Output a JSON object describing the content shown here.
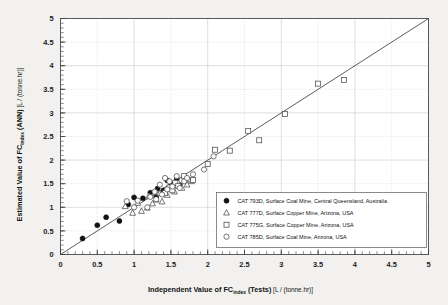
{
  "chart_data": {
    "type": "scatter",
    "title": "",
    "xlabel": "Independent Value of FC",
    "xlabel_sub": "index",
    "xlabel_tail": " (Tests)",
    "xunit": "[L / (tonne.hr)]",
    "ylabel": "Estimated Value of FC",
    "ylabel_sub": "index",
    "ylabel_tail": " (ANN)",
    "yunit": "[L / (tonne.hr)]",
    "xlim": [
      0,
      5
    ],
    "ylim": [
      0,
      5
    ],
    "xticks": [
      "0",
      "0.5",
      "1",
      "1.5",
      "2",
      "2.5",
      "3",
      "3.5",
      "4",
      "4.5",
      "5"
    ],
    "yticks": [
      "0",
      "0.5",
      "1",
      "1.5",
      "2",
      "2.5",
      "3",
      "3.5",
      "4",
      "4.5",
      "5"
    ],
    "minor_tick_step": 0.1,
    "grid": true,
    "legend_position": "lower-right",
    "reference_line": {
      "name": "y = x",
      "from": [
        0,
        0
      ],
      "to": [
        5,
        5
      ]
    },
    "series": [
      {
        "name": "CAT 793D, Surface Coal Mine, Central Queensland, Australia",
        "marker": "filled-circle",
        "points": [
          [
            0.3,
            0.34
          ],
          [
            0.5,
            0.62
          ],
          [
            0.62,
            0.79
          ],
          [
            0.8,
            0.71
          ],
          [
            0.92,
            1.06
          ],
          [
            1.0,
            1.21
          ],
          [
            1.12,
            1.19
          ],
          [
            1.22,
            1.31
          ],
          [
            1.3,
            1.22
          ],
          [
            1.32,
            1.4
          ],
          [
            1.4,
            1.36
          ],
          [
            1.45,
            1.57
          ],
          [
            1.48,
            1.43
          ],
          [
            1.52,
            1.49
          ],
          [
            1.58,
            1.6
          ],
          [
            1.62,
            1.47
          ]
        ]
      },
      {
        "name": "CAT 777D, Surface Copper Mine, Arizona, USA",
        "marker": "open-triangle",
        "points": [
          [
            0.88,
            1.02
          ],
          [
            0.98,
            0.88
          ],
          [
            1.05,
            1.09
          ],
          [
            1.1,
            0.92
          ],
          [
            1.18,
            0.99
          ],
          [
            1.2,
            1.24
          ],
          [
            1.25,
            1.08
          ],
          [
            1.3,
            1.16
          ],
          [
            1.35,
            1.3
          ],
          [
            1.38,
            1.12
          ],
          [
            1.42,
            1.35
          ],
          [
            1.45,
            1.26
          ],
          [
            1.5,
            1.45
          ],
          [
            1.55,
            1.33
          ],
          [
            1.6,
            1.52
          ],
          [
            1.65,
            1.41
          ],
          [
            1.7,
            1.58
          ],
          [
            1.72,
            1.48
          ],
          [
            1.78,
            1.55
          ]
        ]
      },
      {
        "name": "CAT 775G, Surface Copper Mine, Arizona, USA",
        "marker": "open-square",
        "points": [
          [
            1.42,
            1.3
          ],
          [
            1.48,
            1.42
          ],
          [
            1.52,
            1.36
          ],
          [
            1.56,
            1.52
          ],
          [
            1.6,
            1.45
          ],
          [
            1.68,
            1.66
          ],
          [
            1.8,
            1.58
          ],
          [
            2.0,
            1.92
          ],
          [
            2.1,
            2.22
          ],
          [
            2.3,
            2.2
          ],
          [
            2.55,
            2.62
          ],
          [
            2.7,
            2.42
          ],
          [
            3.05,
            2.98
          ],
          [
            3.5,
            3.62
          ],
          [
            3.85,
            3.7
          ]
        ]
      },
      {
        "name": "CAT 785D, Surface Coal Mine, Arizona, USA",
        "marker": "open-circle",
        "points": [
          [
            0.9,
            1.13
          ],
          [
            1.0,
            1.0
          ],
          [
            1.05,
            1.14
          ],
          [
            1.18,
            1.0
          ],
          [
            1.22,
            1.22
          ],
          [
            1.28,
            1.33
          ],
          [
            1.3,
            1.17
          ],
          [
            1.35,
            1.48
          ],
          [
            1.38,
            1.27
          ],
          [
            1.42,
            1.62
          ],
          [
            1.45,
            1.38
          ],
          [
            1.48,
            1.55
          ],
          [
            1.52,
            1.44
          ],
          [
            1.58,
            1.66
          ],
          [
            1.62,
            1.41
          ],
          [
            1.68,
            1.55
          ],
          [
            1.72,
            1.62
          ],
          [
            1.8,
            1.7
          ],
          [
            1.95,
            1.8
          ],
          [
            2.08,
            2.08
          ]
        ]
      }
    ]
  }
}
